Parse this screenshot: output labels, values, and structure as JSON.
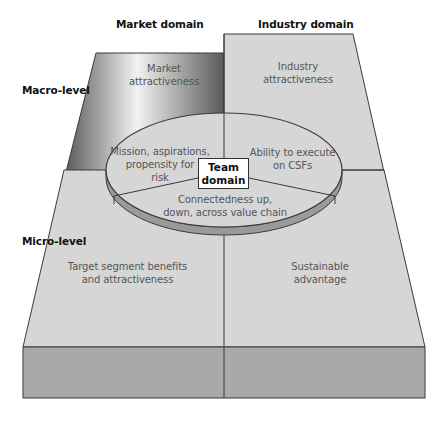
{
  "labels": {
    "market_domain": "Market domain",
    "industry_domain": "Industry domain",
    "macro_level": "Macro-level",
    "micro_level": "Micro-level"
  },
  "cells": {
    "market_macro": [
      "Market",
      "attractiveness"
    ],
    "industry_macro": [
      "Industry",
      "attractiveness"
    ],
    "market_micro": [
      "Target segment benefits",
      "and attractiveness"
    ],
    "industry_micro": [
      "Sustainable",
      "advantage"
    ]
  },
  "team": {
    "title": [
      "Team",
      "domain"
    ],
    "segments": {
      "left": [
        "Mission, aspirations,",
        "propensity for",
        "risk"
      ],
      "right": [
        "Ability to execute",
        "on CSFs"
      ],
      "bottom": [
        "Connectedness up,",
        "down, across value chain"
      ]
    }
  },
  "colors": {
    "panel_light": "#d6d6d6",
    "slab_front": "#a9a9a9",
    "wall_dark": "#6e6e6e",
    "outline": "#3a3a3a"
  }
}
